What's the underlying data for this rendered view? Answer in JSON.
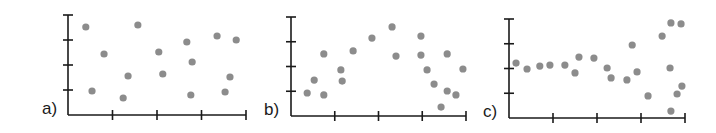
{
  "figure": {
    "panels": [
      {
        "id": "a",
        "label": "a)"
      },
      {
        "id": "b",
        "label": "b)"
      },
      {
        "id": "c",
        "label": "c)"
      }
    ],
    "colors": {
      "axis": "#1a1a1a",
      "point": "#8c8c8c",
      "background": "#ffffff"
    }
  },
  "chart_data": [
    {
      "type": "scatter",
      "title": "a)",
      "xlabel": "",
      "ylabel": "",
      "xlim": [
        0,
        4
      ],
      "ylim": [
        0,
        4
      ],
      "xticks": [
        1,
        2,
        3,
        4
      ],
      "yticks": [
        1,
        2,
        3,
        4
      ],
      "tick_labels": false,
      "grid": false,
      "description": "no correlation",
      "points": [
        [
          0.4,
          3.52
        ],
        [
          1.57,
          3.6
        ],
        [
          0.81,
          2.44
        ],
        [
          2.04,
          2.52
        ],
        [
          2.67,
          2.92
        ],
        [
          3.35,
          3.16
        ],
        [
          3.78,
          3.0
        ],
        [
          2.79,
          2.12
        ],
        [
          1.35,
          1.56
        ],
        [
          2.13,
          1.64
        ],
        [
          3.64,
          1.52
        ],
        [
          0.54,
          0.96
        ],
        [
          1.24,
          0.68
        ],
        [
          2.76,
          0.8
        ],
        [
          3.53,
          0.92
        ]
      ]
    },
    {
      "type": "scatter",
      "title": "b)",
      "xlabel": "",
      "ylabel": "",
      "xlim": [
        0,
        4
      ],
      "ylim": [
        0,
        4
      ],
      "xticks": [
        1,
        2,
        3,
        4
      ],
      "yticks": [
        1,
        2,
        3,
        4
      ],
      "tick_labels": false,
      "grid": false,
      "description": "non-linear (inverted-U) relationship",
      "points": [
        [
          0.37,
          0.93
        ],
        [
          0.53,
          1.45
        ],
        [
          0.75,
          0.85
        ],
        [
          0.75,
          2.51
        ],
        [
          1.14,
          1.86
        ],
        [
          1.17,
          1.41
        ],
        [
          1.42,
          2.63
        ],
        [
          1.85,
          3.15
        ],
        [
          2.31,
          3.6
        ],
        [
          2.4,
          2.42
        ],
        [
          2.97,
          3.23
        ],
        [
          2.97,
          2.46
        ],
        [
          3.11,
          1.86
        ],
        [
          3.27,
          1.29
        ],
        [
          3.57,
          2.51
        ],
        [
          3.43,
          0.36
        ],
        [
          3.57,
          1.01
        ],
        [
          3.77,
          0.85
        ],
        [
          3.93,
          1.9
        ]
      ]
    },
    {
      "type": "scatter",
      "title": "c)",
      "xlabel": "",
      "ylabel": "",
      "xlim": [
        0,
        4
      ],
      "ylim": [
        0,
        4
      ],
      "xticks": [
        1,
        2,
        3,
        4
      ],
      "yticks": [
        1,
        2,
        3,
        4
      ],
      "tick_labels": false,
      "grid": false,
      "description": "flat, increasing spread (heteroscedastic)",
      "points": [
        [
          0.16,
          2.22
        ],
        [
          0.41,
          1.98
        ],
        [
          0.7,
          2.1
        ],
        [
          0.93,
          2.14
        ],
        [
          1.27,
          2.14
        ],
        [
          1.5,
          1.82
        ],
        [
          1.59,
          2.46
        ],
        [
          1.93,
          2.42
        ],
        [
          2.23,
          2.02
        ],
        [
          2.32,
          1.62
        ],
        [
          2.68,
          1.54
        ],
        [
          2.8,
          2.95
        ],
        [
          2.91,
          1.86
        ],
        [
          3.16,
          0.89
        ],
        [
          3.48,
          3.31
        ],
        [
          3.68,
          3.84
        ],
        [
          3.91,
          3.8
        ],
        [
          3.66,
          2.02
        ],
        [
          3.93,
          1.29
        ],
        [
          3.82,
          0.97
        ],
        [
          3.68,
          0.28
        ]
      ]
    }
  ]
}
